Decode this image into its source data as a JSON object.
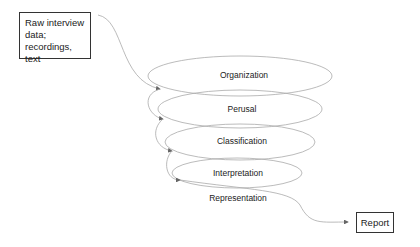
{
  "diagram": {
    "input_box": {
      "lines": [
        "Raw interview",
        "data;",
        "recordings, text"
      ]
    },
    "stages": [
      {
        "label": "Organization"
      },
      {
        "label": "Perusal"
      },
      {
        "label": "Classification"
      },
      {
        "label": "Interpretation"
      },
      {
        "label": "Representation"
      }
    ],
    "output_box": {
      "label": "Report"
    },
    "colors": {
      "line": "#999999",
      "box_border": "#333333"
    }
  }
}
